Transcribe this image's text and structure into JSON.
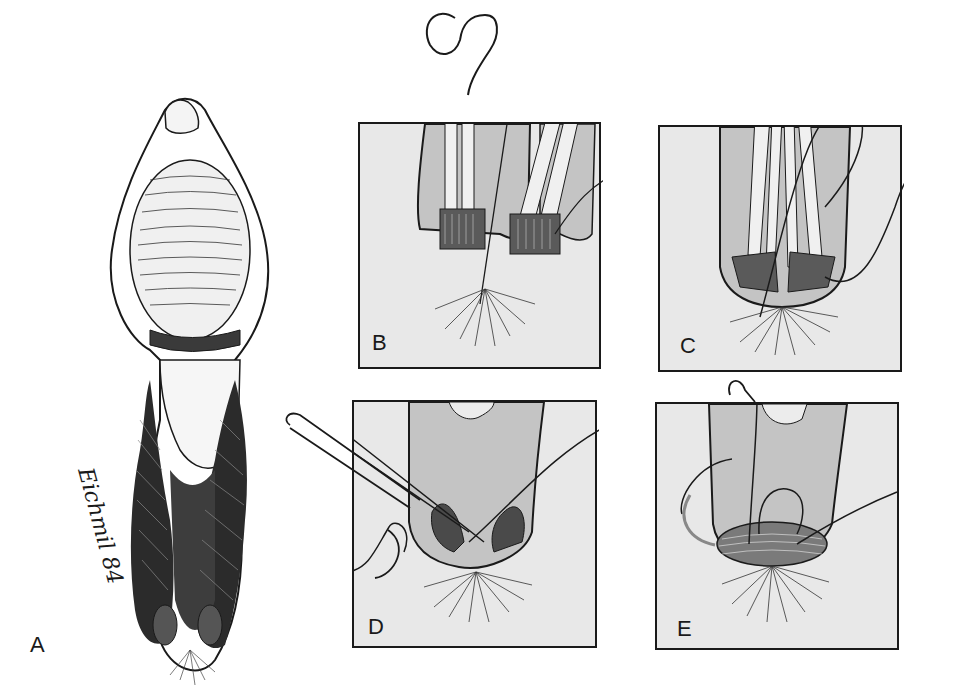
{
  "figure": {
    "panels": [
      {
        "id": "A",
        "label": "A",
        "content": "Overview of exposed perineum with retracted tissue and dark hatched sphincter muscle"
      },
      {
        "id": "B",
        "label": "B",
        "content": "Clamps holding separated sphincter ends with suture"
      },
      {
        "id": "C",
        "label": "C",
        "content": "Sphincter ends approximated with clamps and suture loop"
      },
      {
        "id": "D",
        "label": "D",
        "content": "Needle passing suture through overlapping sphincter ends"
      },
      {
        "id": "E",
        "label": "E",
        "content": "Completed overlapped sphincter repair with suture tied"
      }
    ],
    "signature": "Eichmil 84"
  },
  "colors": {
    "panel_fill": "#e8e8e8",
    "tissue_gray": "#c4c4c4",
    "ink": "#1a1a1a",
    "background": "#ffffff"
  }
}
